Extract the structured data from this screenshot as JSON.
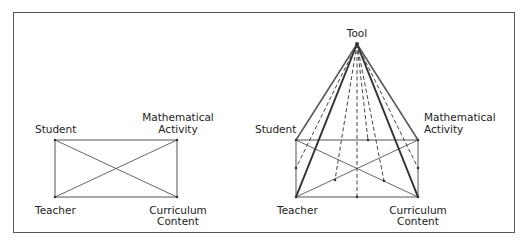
{
  "diagram": {
    "left": {
      "labels": {
        "student": "Student",
        "math_line1": "Mathematical",
        "math_line2": "Activity",
        "teacher": "Teacher",
        "curr_line1": "Curriculum",
        "curr_line2": "Content"
      }
    },
    "right": {
      "labels": {
        "tool": "Tool",
        "student": "Student",
        "math_line1": "Mathematical",
        "math_line2": "Activity",
        "teacher": "Teacher",
        "curr_line1": "Curriculum",
        "curr_line2": "Content"
      }
    },
    "colors": {
      "fill": "#ededed",
      "stroke": "#555555",
      "border": "#555555"
    }
  }
}
